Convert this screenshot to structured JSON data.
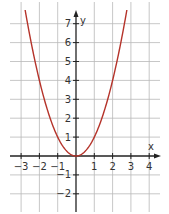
{
  "chart_data": {
    "type": "line",
    "title": "",
    "function": "y = x^2",
    "xlabel": "x",
    "ylabel": "y",
    "xlim": [
      -3.5,
      4.5
    ],
    "ylim": [
      -2.5,
      7.5
    ],
    "x_ticks": [
      -3,
      -2,
      -1,
      1,
      2,
      3,
      4
    ],
    "x_tick_labels": [
      "−3",
      "−2",
      "−1",
      "1",
      "2",
      "3",
      "4"
    ],
    "y_ticks": [
      -2,
      -1,
      1,
      2,
      3,
      4,
      5,
      6,
      7
    ],
    "y_tick_labels": [
      "−2",
      "−1",
      "1",
      "2",
      "3",
      "4",
      "5",
      "6",
      "7"
    ],
    "grid": true,
    "series": [
      {
        "name": "parabola",
        "color": "#b5332a",
        "x": [
          -2.75,
          -2.5,
          -2,
          -1.5,
          -1,
          -0.5,
          0,
          0.5,
          1,
          1.5,
          2,
          2.5,
          2.75
        ],
        "values": [
          7.5625,
          6.25,
          4,
          2.25,
          1,
          0.25,
          0,
          0.25,
          1,
          2.25,
          4,
          6.25,
          7.5625
        ]
      }
    ]
  },
  "colors": {
    "grid": "#b9b9b9",
    "axis": "#222222",
    "curve": "#b5332a"
  }
}
